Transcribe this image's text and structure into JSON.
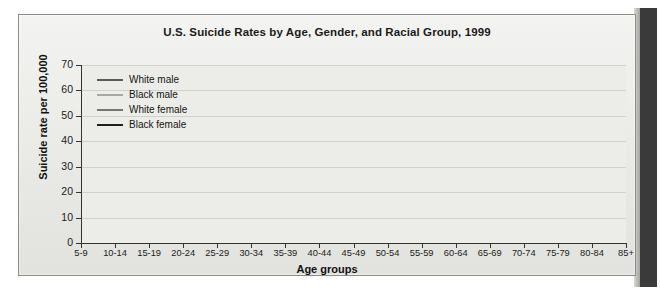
{
  "chart_data": {
    "type": "line",
    "title": "U.S. Suicide Rates by Age, Gender, and Racial Group, 1999",
    "xlabel": "Age groups",
    "ylabel": "Suicide rate per 100,000",
    "ylim": [
      0,
      70
    ],
    "yticks": [
      0,
      10,
      20,
      30,
      40,
      50,
      60,
      70
    ],
    "grid": true,
    "legend_position": "top-left",
    "categories": [
      "5-9",
      "10-14",
      "15-19",
      "20-24",
      "25-29",
      "30-34",
      "35-39",
      "40-44",
      "45-49",
      "50-54",
      "55-59",
      "60-64",
      "65-69",
      "70-74",
      "75-79",
      "80-84",
      "85+"
    ],
    "series": [
      {
        "name": "White male",
        "color": "#5a5a56",
        "width": 2.0,
        "values": [
          0,
          1.5,
          13.5,
          23.0,
          23.5,
          23.8,
          24.0,
          24.2,
          24.8,
          24.0,
          23.2,
          22.0,
          22.3,
          26.5,
          33.0,
          43.0,
          60.0
        ]
      },
      {
        "name": "Black male",
        "color": "#a8a8a4",
        "width": 2.0,
        "values": [
          0,
          1.2,
          12.5,
          20.8,
          20.6,
          20.0,
          19.8,
          15.5,
          13.0,
          14.0,
          12.0,
          11.0,
          10.8,
          11.5,
          14.0,
          13.8,
          13.8
        ]
      },
      {
        "name": "White female",
        "color": "#76766f",
        "width": 1.6,
        "values": [
          0,
          0.5,
          2.8,
          3.6,
          4.2,
          5.0,
          6.2,
          7.0,
          7.2,
          7.1,
          6.6,
          5.8,
          5.0,
          4.6,
          4.6,
          4.2,
          3.2
        ]
      },
      {
        "name": "Black female",
        "color": "#1f1f1c",
        "width": 1.8,
        "values": [
          0,
          0.3,
          1.3,
          1.8,
          2.0,
          2.1,
          2.3,
          2.6,
          2.5,
          2.3,
          2.0,
          1.9,
          1.8,
          1.7,
          1.6,
          1.5,
          1.6
        ]
      }
    ]
  }
}
